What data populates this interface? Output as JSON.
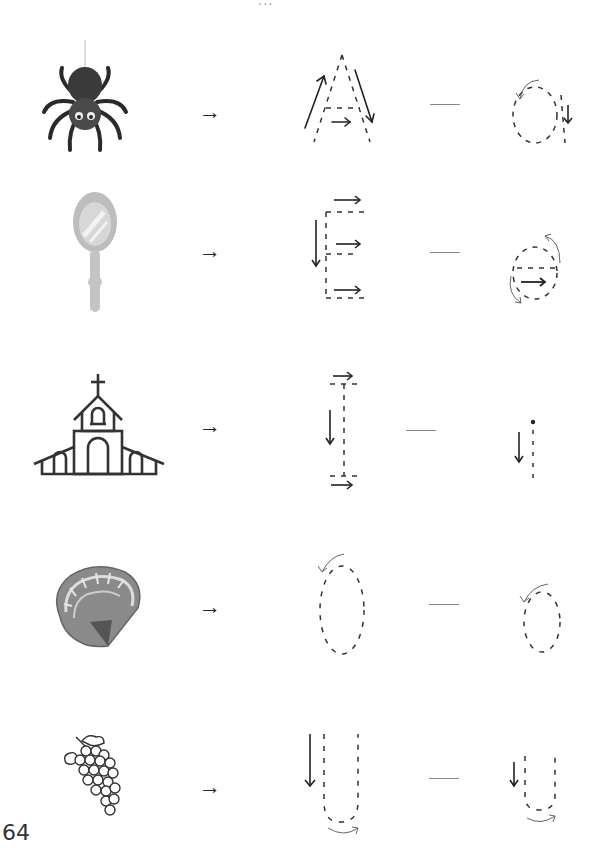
{
  "page": {
    "header_partial": "...",
    "page_number": "64"
  },
  "symbols": {
    "arrow_right": "→"
  },
  "rows": [
    {
      "picture": "spider",
      "uppercase": "A",
      "lowercase": "a"
    },
    {
      "picture": "hand-mirror",
      "uppercase": "E",
      "lowercase": "e"
    },
    {
      "picture": "church",
      "uppercase": "I",
      "lowercase": "i"
    },
    {
      "picture": "seashell",
      "uppercase": "O",
      "lowercase": "o"
    },
    {
      "picture": "grapes",
      "uppercase": "U",
      "lowercase": "u"
    }
  ],
  "colors": {
    "ink": "#222222",
    "dashes": "#333333",
    "guide_arrow": "#555555",
    "separator": "#888888",
    "mirror_gray": "#bdbdbd"
  }
}
